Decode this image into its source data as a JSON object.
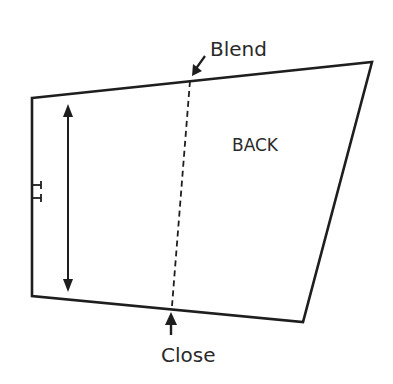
{
  "diagram": {
    "piece_label": "BACK",
    "top_annotation": "Blend",
    "bottom_annotation": "Close",
    "colors": {
      "line": "#1e1e1e",
      "text": "#2a2a2a",
      "background": "#ffffff"
    }
  }
}
